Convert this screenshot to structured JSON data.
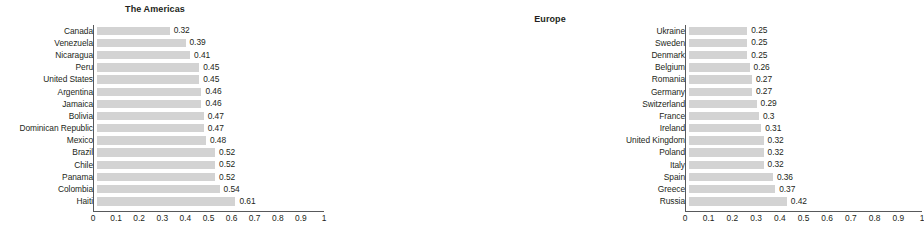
{
  "chart_data": [
    {
      "type": "bar",
      "orientation": "horizontal",
      "title": "The Americas",
      "xlabel": "",
      "ylabel": "",
      "xlim": [
        0,
        1
      ],
      "grid": false,
      "legend": null,
      "tick_labels": [
        "0",
        "0.1",
        "0.2",
        "0.3",
        "0.4",
        "0.5",
        "0.6",
        "0.7",
        "0.8",
        "0.9",
        "1"
      ],
      "tick_values": [
        0,
        0.1,
        0.2,
        0.3,
        0.4,
        0.5,
        0.6,
        0.7,
        0.8,
        0.9,
        1
      ],
      "categories": [
        "Canada",
        "Venezuela",
        "Nicaragua",
        "Peru",
        "United States",
        "Argentina",
        "Jamaica",
        "Bolivia",
        "Dominican Republic",
        "Mexico",
        "Brazil",
        "Chile",
        "Panama",
        "Colombia",
        "Haiti"
      ],
      "values": [
        0.32,
        0.39,
        0.41,
        0.45,
        0.45,
        0.46,
        0.46,
        0.47,
        0.47,
        0.48,
        0.52,
        0.52,
        0.52,
        0.54,
        0.61
      ],
      "value_labels": [
        "0.32",
        "0.39",
        "0.41",
        "0.45",
        "0.45",
        "0.46",
        "0.46",
        "0.47",
        "0.47",
        "0.48",
        "0.52",
        "0.52",
        "0.52",
        "0.54",
        "0.61"
      ],
      "bar_color": "#d3d3d3",
      "axis_color": "#58595b"
    },
    {
      "type": "bar",
      "orientation": "horizontal",
      "title": "Europe",
      "xlabel": "",
      "ylabel": "",
      "xlim": [
        0,
        1
      ],
      "grid": false,
      "legend": null,
      "tick_labels": [
        "0",
        "0.1",
        "0.2",
        "0.3",
        "0.4",
        "0.5",
        "0.6",
        "0.7",
        "0.8",
        "0.9",
        "1"
      ],
      "tick_values": [
        0,
        0.1,
        0.2,
        0.3,
        0.4,
        0.5,
        0.6,
        0.7,
        0.8,
        0.9,
        1
      ],
      "categories": [
        "Ukraine",
        "Sweden",
        "Denmark",
        "Belgium",
        "Romania",
        "Germany",
        "Switzerland",
        "France",
        "Ireland",
        "United Kingdom",
        "Poland",
        "Italy",
        "Spain",
        "Greece",
        "Russia"
      ],
      "values": [
        0.25,
        0.25,
        0.25,
        0.26,
        0.27,
        0.27,
        0.29,
        0.3,
        0.31,
        0.32,
        0.32,
        0.32,
        0.36,
        0.37,
        0.42
      ],
      "value_labels": [
        "0.25",
        "0.25",
        "0.25",
        "0.26",
        "0.27",
        "0.27",
        "0.29",
        "0.3",
        "0.31",
        "0.32",
        "0.32",
        "0.32",
        "0.36",
        "0.37",
        "0.42"
      ],
      "bar_color": "#d3d3d3",
      "axis_color": "#58595b"
    }
  ]
}
